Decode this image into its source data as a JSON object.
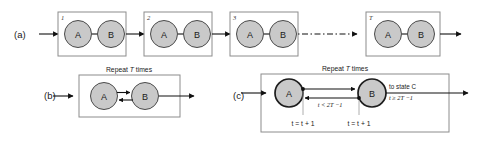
{
  "figure": {
    "background": "#ffffff",
    "node_fill": "#c9c9c9",
    "node_stroke_thin": "#4a4a4a",
    "node_stroke_thick": "#1c1c1c",
    "box_stroke": "#8c8c8c",
    "line_color": "#111111"
  },
  "panels": [
    {
      "id": "a",
      "label": "(a)",
      "boxes": [
        {
          "number": "1",
          "nodes": [
            "A",
            "B"
          ]
        },
        {
          "number": "2",
          "nodes": [
            "A",
            "B"
          ]
        },
        {
          "number": "3",
          "nodes": [
            "A",
            "B"
          ]
        },
        {
          "number": "T",
          "nodes": [
            "A",
            "B"
          ]
        }
      ],
      "ellipsis": "dash-dot"
    },
    {
      "id": "b",
      "label": "(b)",
      "caption_prefix": "Repeat ",
      "caption_var": "T",
      "caption_suffix": " times",
      "nodes": [
        "A",
        "B"
      ],
      "edges": [
        "A-to-B",
        "B-to-A"
      ]
    },
    {
      "id": "c",
      "label": "(c)",
      "caption_prefix": "Repeat ",
      "caption_var": "T",
      "caption_suffix": " times",
      "nodes": [
        "A",
        "B"
      ],
      "edge_back_label": "t < 2T −1",
      "exit_label_line1": "to state C",
      "exit_label_line2": "t ≥ 2T −1",
      "counter_label_left": "t = t + 1",
      "counter_label_right": "t = t + 1"
    }
  ]
}
